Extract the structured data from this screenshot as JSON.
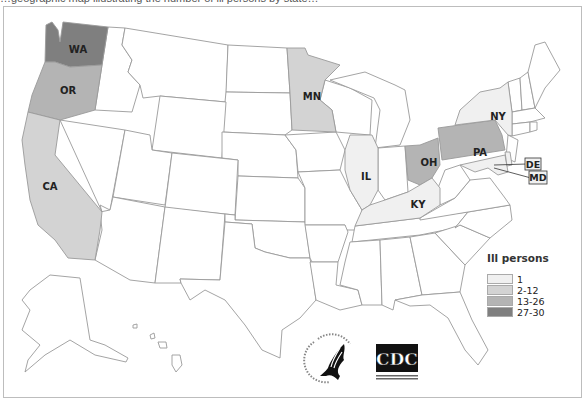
{
  "title_fragment": "…geographic map illustrating the number of ill persons by state…",
  "map": {
    "type": "choropleth",
    "region": "United States",
    "legend": {
      "title": "Ill persons",
      "bins": [
        {
          "label": "1",
          "color": "#f0f0f0"
        },
        {
          "label": "2-12",
          "color": "#d3d3d3"
        },
        {
          "label": "13-26",
          "color": "#b4b4b4"
        },
        {
          "label": "27-30",
          "color": "#7f7f7f"
        }
      ]
    },
    "states": [
      {
        "abbr": "WA",
        "bin": "27-30"
      },
      {
        "abbr": "OR",
        "bin": "13-26"
      },
      {
        "abbr": "CA",
        "bin": "2-12"
      },
      {
        "abbr": "MN",
        "bin": "2-12"
      },
      {
        "abbr": "IL",
        "bin": "1"
      },
      {
        "abbr": "OH",
        "bin": "13-26"
      },
      {
        "abbr": "PA",
        "bin": "13-26"
      },
      {
        "abbr": "NY",
        "bin": "1"
      },
      {
        "abbr": "KY",
        "bin": "1"
      },
      {
        "abbr": "DE",
        "bin": "1"
      },
      {
        "abbr": "MD",
        "bin": "1"
      }
    ]
  },
  "logos": {
    "hhs": "U.S. Department of Health & Human Services",
    "cdc_text": "CDC",
    "cdc_subtitle": "Centers for Disease Control and Prevention"
  }
}
